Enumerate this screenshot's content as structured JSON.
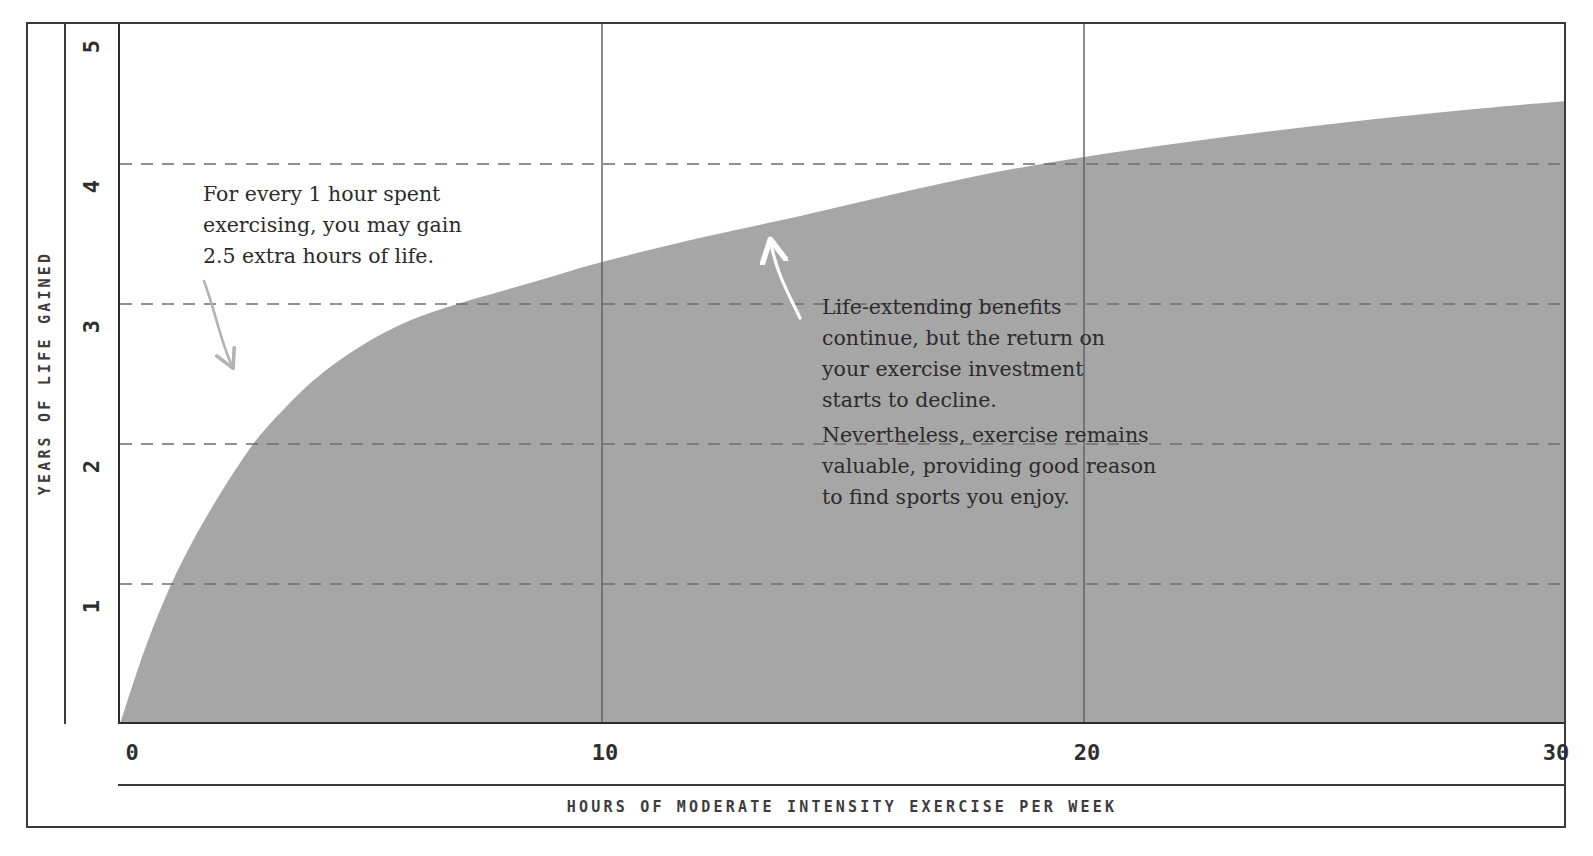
{
  "chart_data": {
    "type": "area",
    "title": "",
    "xlabel": "HOURS OF MODERATE INTENSITY EXERCISE PER WEEK",
    "ylabel": "YEARS OF LIFE GAINED",
    "xlim": [
      0,
      30
    ],
    "ylim": [
      0,
      5
    ],
    "xticks": [
      0,
      10,
      20,
      30
    ],
    "xtick_labels": [
      "0",
      "10",
      "20",
      "30"
    ],
    "yticks": [
      1,
      2,
      3,
      4,
      5
    ],
    "ytick_labels": [
      "1",
      "2",
      "3",
      "4",
      "5"
    ],
    "grid": "dashed horizontal gridlines at y = 1, 2, 3, 4; solid vertical gridlines at x = 10 and x = 20",
    "legend": "none",
    "fill_color": "#a6a6a6",
    "series": [
      {
        "name": "Years of life gained",
        "x": [
          0,
          0.5,
          1,
          1.5,
          2,
          2.5,
          3,
          4,
          5,
          6,
          7,
          8,
          9,
          10,
          12,
          14,
          16,
          18,
          20,
          22,
          24,
          26,
          28,
          30
        ],
        "values": [
          0,
          0.52,
          0.95,
          1.3,
          1.6,
          1.87,
          2.1,
          2.45,
          2.7,
          2.88,
          3.0,
          3.1,
          3.2,
          3.3,
          3.47,
          3.62,
          3.78,
          3.93,
          4.05,
          4.15,
          4.24,
          4.32,
          4.39,
          4.45
        ]
      }
    ],
    "annotations": [
      {
        "id": "annotation-1",
        "text": "For every 1 hour spent\nexercising, you may gain\n2.5 extra hours of life.",
        "arrow": "curved gray arrow pointing down-right toward the rising part of the curve"
      },
      {
        "id": "annotation-2",
        "text": "Life-extending benefits\ncontinue, but the return on\nyour exercise investment\nstarts to decline.",
        "arrow": "curved white arrow pointing up toward the flattening part of the curve"
      },
      {
        "id": "annotation-3",
        "text": "Nevertheless, exercise remains\nvaluable, providing good reason\nto find sports you enjoy.",
        "arrow": "none"
      }
    ]
  },
  "axes": {
    "y_title": "YEARS OF LIFE GAINED",
    "x_title": "HOURS OF MODERATE INTENSITY EXERCISE PER WEEK"
  },
  "colors": {
    "area_fill": "#a6a6a6",
    "frame": "#3a3a3a",
    "axis": "#2d2d2d",
    "gridline": "#6e6e6e",
    "text": "#2b2b2b",
    "arrow_gray": "#b0b0b0",
    "arrow_white": "#ffffff"
  }
}
